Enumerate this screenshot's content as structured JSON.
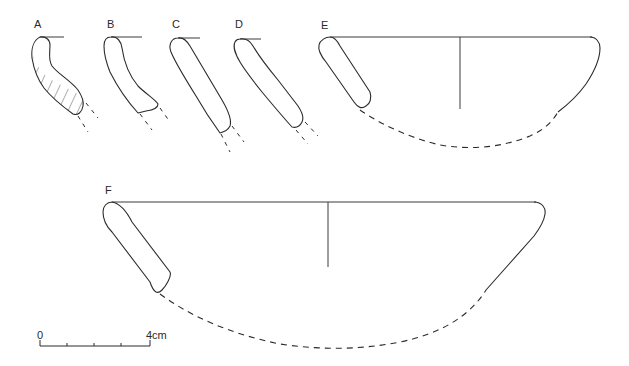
{
  "figure": {
    "profiles": [
      {
        "id": "A",
        "label": "A"
      },
      {
        "id": "B",
        "label": "B"
      },
      {
        "id": "C",
        "label": "C"
      },
      {
        "id": "D",
        "label": "D"
      },
      {
        "id": "E",
        "label": "E",
        "reconstructed_bowl": true
      },
      {
        "id": "F",
        "label": "F",
        "reconstructed_bowl": true
      }
    ],
    "scale_bar": {
      "start_label": "0",
      "end_label": "4cm",
      "divisions": 4
    },
    "colors": {
      "ink": "#2b2b2b",
      "background": "#ffffff"
    }
  }
}
